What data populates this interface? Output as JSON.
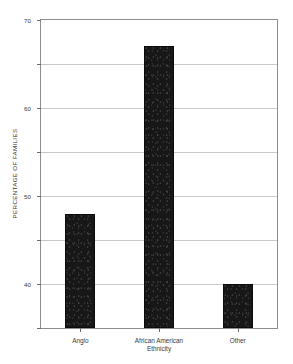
{
  "chart_data": {
    "type": "bar",
    "title": "",
    "subtitle": "",
    "categories": [
      "Anglo",
      "African American",
      "Other"
    ],
    "values": [
      26,
      64,
      10
    ],
    "series": [
      {
        "name": "Percentage of families",
        "values": [
          26,
          64,
          10
        ]
      }
    ],
    "xlabel": "Ethnicity",
    "ylabel": "PERCENTAGE OF FAMILIES",
    "ylim": [
      0,
      70
    ],
    "yticks": [
      0,
      10,
      20,
      30,
      40,
      50,
      60,
      70
    ],
    "ytick_labels": [
      "0",
      "10",
      "20",
      "30",
      "40",
      "50",
      "60",
      "70"
    ],
    "xlim": [
      0,
      3
    ],
    "grid": true,
    "grid_axis": "y",
    "legend": false,
    "legend_position": "none",
    "bar_color": "#171717",
    "grid_color": "#c9c9c9",
    "axis_color": "#8d8d8d",
    "text_color": "#3a3a3a",
    "background_color": "#ffffff",
    "annotations": []
  }
}
